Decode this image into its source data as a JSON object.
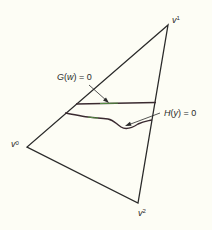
{
  "diagram": {
    "vertices": [
      {
        "id": "v0",
        "base": "v",
        "sup": "0"
      },
      {
        "id": "v1",
        "base": "v",
        "sup": "1"
      },
      {
        "id": "v2",
        "base": "v",
        "sup": "2"
      }
    ],
    "curves": [
      {
        "id": "G",
        "label_func": "G",
        "label_arg": "w",
        "label_rest": " = 0",
        "full_label": "G(w) = 0"
      },
      {
        "id": "H",
        "label_func": "H",
        "label_arg": "y",
        "label_rest": " = 0",
        "full_label": "H(y) = 0"
      }
    ],
    "colors": {
      "stroke": "#2a2a2a",
      "curve": "#3a2a30",
      "highlight": "#5fae4a",
      "background": "#fdfdf5"
    }
  }
}
